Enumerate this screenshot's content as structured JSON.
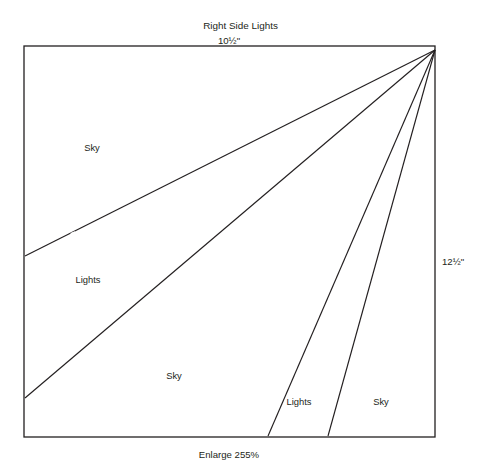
{
  "title": "Right Side Lights",
  "dimensions": {
    "top": "10½\"",
    "right": "12½\""
  },
  "footer": "Enlarge 255%",
  "colors": {
    "ink": "#231f20",
    "paper": "#ffffff"
  },
  "regions": [
    {
      "label": "Sky",
      "x": 92,
      "y": 151
    },
    {
      "label": "Lights",
      "x": 88,
      "y": 283
    },
    {
      "label": "Sky",
      "x": 174,
      "y": 379
    },
    {
      "label": "Lights",
      "x": 299,
      "y": 405
    },
    {
      "label": "Sky",
      "x": 381,
      "y": 405
    }
  ],
  "chart_data": {
    "type": "diagram",
    "title": "Right Side Lights",
    "subtitle": "10½\"",
    "units": "inches",
    "block": {
      "width_label": "10½\"",
      "height_label": "12½\"",
      "x": 24,
      "y": 46,
      "w": 411,
      "h": 391
    },
    "apex": {
      "x": 435,
      "y": 50
    },
    "rays": [
      {
        "name": "ray-1",
        "to_edge": "left",
        "x": 25,
        "y": 256
      },
      {
        "name": "ray-2",
        "to_edge": "left",
        "x": 25,
        "y": 398
      },
      {
        "name": "ray-3",
        "to_edge": "bottom",
        "x": 268,
        "y": 436
      },
      {
        "name": "ray-4",
        "to_edge": "bottom",
        "x": 328,
        "y": 436
      }
    ],
    "registration_gaps": [
      {
        "name": "gap-1",
        "x": 73,
        "y": 233
      },
      {
        "name": "gap-2",
        "x": 236,
        "y": 224
      }
    ],
    "section_labels": [
      "Sky",
      "Lights",
      "Sky",
      "Lights",
      "Sky"
    ],
    "legend": [],
    "grid": false
  }
}
